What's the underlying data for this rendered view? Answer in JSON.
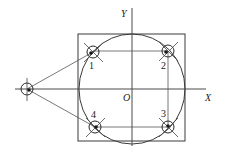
{
  "diagram": {
    "axes": {
      "x_label": "X",
      "y_label": "Y",
      "origin_label": "O",
      "origin": [
        132,
        89
      ]
    },
    "square": {
      "x": 78,
      "y": 34,
      "width": 107,
      "height": 107
    },
    "circle": {
      "cx": 132,
      "cy": 89,
      "rx": 53,
      "ry": 55
    },
    "points": [
      {
        "id": "1",
        "label": "1",
        "x": 93,
        "y": 52
      },
      {
        "id": "2",
        "label": "2",
        "x": 168,
        "y": 51
      },
      {
        "id": "3",
        "label": "3",
        "x": 168,
        "y": 127
      },
      {
        "id": "4",
        "label": "4",
        "x": 95,
        "y": 127
      }
    ],
    "start_point": {
      "x": 27,
      "y": 89
    },
    "path_order": [
      "start",
      "1",
      "2",
      "3",
      "4",
      "start"
    ]
  }
}
